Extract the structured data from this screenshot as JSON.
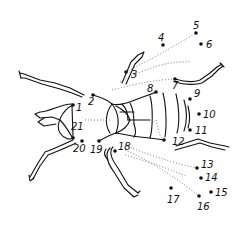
{
  "puzzle": {
    "subject": "fly",
    "line_color": "#111111",
    "dots": [
      {
        "n": "1",
        "x": 73,
        "y": 105,
        "lx": 76,
        "ly": 111
      },
      {
        "n": "2",
        "x": 93,
        "y": 95,
        "lx": 88,
        "ly": 105
      },
      {
        "n": "3",
        "x": 126,
        "y": 72,
        "lx": 131,
        "ly": 78
      },
      {
        "n": "4",
        "x": 163,
        "y": 45,
        "lx": 158,
        "ly": 41
      },
      {
        "n": "5",
        "x": 196,
        "y": 33,
        "lx": 193,
        "ly": 29
      },
      {
        "n": "6",
        "x": 201,
        "y": 44,
        "lx": 206,
        "ly": 48
      },
      {
        "n": "7",
        "x": 175,
        "y": 79,
        "lx": 172,
        "ly": 89
      },
      {
        "n": "8",
        "x": 156,
        "y": 92,
        "lx": 147,
        "ly": 92
      },
      {
        "n": "9",
        "x": 190,
        "y": 99,
        "lx": 194,
        "ly": 97
      },
      {
        "n": "10",
        "x": 199,
        "y": 114,
        "lx": 203,
        "ly": 118
      },
      {
        "n": "11",
        "x": 190,
        "y": 130,
        "lx": 195,
        "ly": 134
      },
      {
        "n": "12",
        "x": 164,
        "y": 140,
        "lx": 172,
        "ly": 145
      },
      {
        "n": "13",
        "x": 197,
        "y": 168,
        "lx": 201,
        "ly": 168
      },
      {
        "n": "14",
        "x": 201,
        "y": 178,
        "lx": 205,
        "ly": 181
      },
      {
        "n": "15",
        "x": 211,
        "y": 192,
        "lx": 215,
        "ly": 196
      },
      {
        "n": "16",
        "x": 199,
        "y": 196,
        "lx": 197,
        "ly": 210
      },
      {
        "n": "17",
        "x": 171,
        "y": 188,
        "lx": 167,
        "ly": 203
      },
      {
        "n": "18",
        "x": 115,
        "y": 151,
        "lx": 118,
        "ly": 150
      },
      {
        "n": "19",
        "x": 99,
        "y": 141,
        "lx": 90,
        "ly": 153
      },
      {
        "n": "20",
        "x": 82,
        "y": 141,
        "lx": 73,
        "ly": 152
      },
      {
        "n": "21",
        "x": 73,
        "y": 138,
        "lx": 71,
        "ly": 130
      }
    ]
  }
}
